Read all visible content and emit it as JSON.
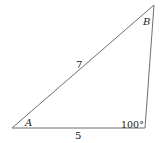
{
  "diagram": {
    "type": "triangle",
    "stroke_color": "#6f6f6f",
    "vertices": {
      "A": {
        "x": 12,
        "y": 128
      },
      "C": {
        "x": 145,
        "y": 128
      },
      "B": {
        "x": 154,
        "y": 5
      }
    },
    "labels": {
      "vertex_a": "A",
      "vertex_b": "B",
      "side_ab": "7",
      "side_ac": "5",
      "angle_c": "100°"
    }
  }
}
